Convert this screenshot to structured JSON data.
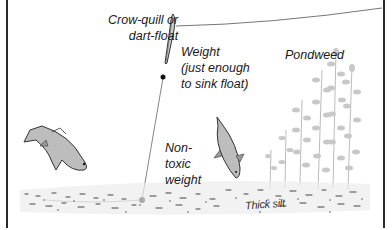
{
  "diagram": {
    "labels": {
      "float": "Crow-quill or\ndart-float",
      "weight": "Weight\n(just enough\nto sink float)",
      "pondweed": "Pondweed",
      "bottom_weight": "Non-\ntoxic\nweight",
      "bottom": "Thick silt"
    },
    "elements": [
      "fishing-line",
      "float",
      "split-shot",
      "bottom-weight",
      "fish-left",
      "fish-center",
      "pondweed",
      "silt-bed"
    ],
    "colors": {
      "line": "#555555",
      "ink": "#1a1a1a",
      "fish": "#b8b8b8",
      "weed": "#c4c4c4",
      "silt": "#444444",
      "border": "#2b2b2b"
    }
  }
}
